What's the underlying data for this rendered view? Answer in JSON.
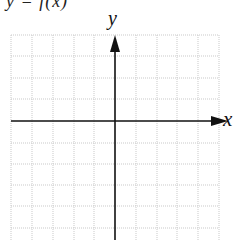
{
  "figure": {
    "caption_partial": "y = f(x)",
    "x_axis_label": "x",
    "y_axis_label": "y",
    "grid": {
      "columns": 10,
      "rows_visible": 10,
      "line_color": "#c8c8c8",
      "line_style": "dotted"
    },
    "axes_color": "#111111"
  }
}
